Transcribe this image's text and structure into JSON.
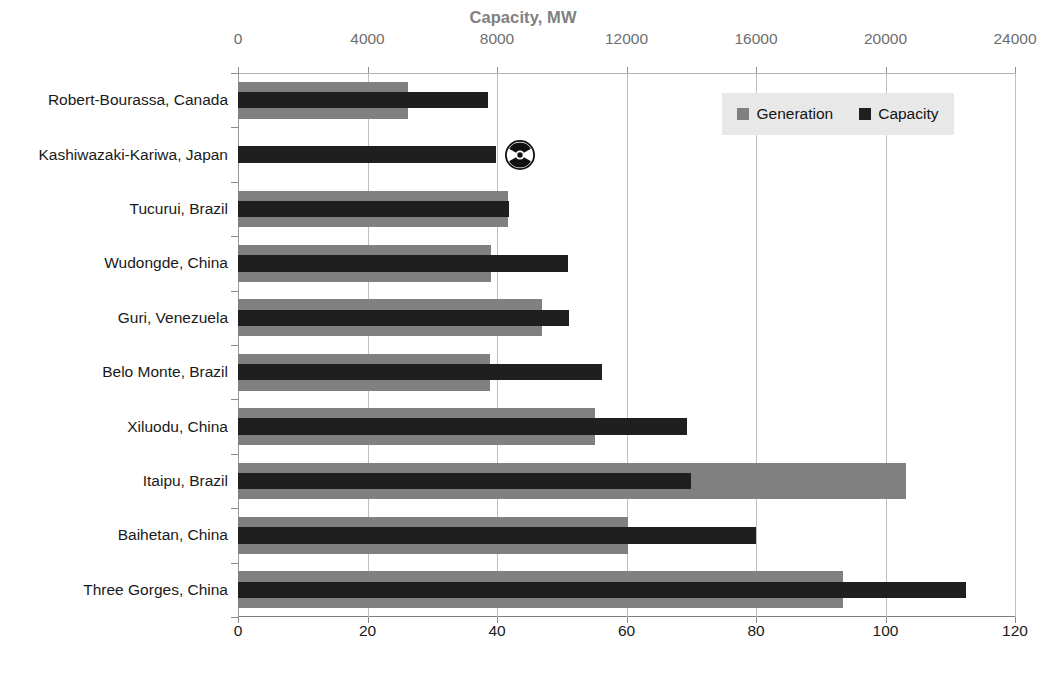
{
  "chart_data": {
    "type": "bar",
    "orientation": "horizontal",
    "title": "",
    "categories": [
      "Robert-Bourassa, Canada",
      "Kashiwazaki-Kariwa, Japan",
      "Tucurui, Brazil",
      "Wudongde, China",
      "Guri, Venezuela",
      "Belo Monte, Brazil",
      "Xiluodu, China",
      "Itaipu, Brazil",
      "Baihetan, China",
      "Three Gorges, China"
    ],
    "series": [
      {
        "name": "Generation",
        "unit": "TWh/year",
        "color": "#808080",
        "axis": "bottom",
        "values": [
          26.3,
          0,
          41.7,
          39.0,
          47.0,
          38.9,
          55.2,
          103.1,
          60.2,
          93.5
        ]
      },
      {
        "name": "Capacity",
        "unit": "MW",
        "color": "#1f1f1f",
        "axis": "top",
        "values": [
          7722,
          7965,
          8370,
          10200,
          10235,
          11233,
          13860,
          14000,
          16000,
          22500
        ]
      }
    ],
    "axes": {
      "top": {
        "label": "Capacity, MW",
        "ticks": [
          0,
          4000,
          8000,
          12000,
          16000,
          20000,
          24000
        ],
        "tick_labels": [
          "0",
          "4000",
          "8000",
          "12000",
          "16000",
          "20000",
          "24000"
        ],
        "min": 0,
        "max": 24000,
        "color": "#808080"
      },
      "bottom": {
        "label": "Generation, TWh/year",
        "ticks": [
          0,
          20,
          40,
          60,
          80,
          100,
          120
        ],
        "tick_labels": [
          "0",
          "20",
          "40",
          "60",
          "80",
          "100",
          "120"
        ],
        "min": 0,
        "max": 120,
        "color": "#141414"
      }
    },
    "grid": {
      "vertical": true,
      "horizontal": false
    },
    "legend": {
      "position": "top-right",
      "background": "#e8e8e8",
      "entries": [
        {
          "label": "Generation",
          "color": "#808080"
        },
        {
          "label": "Capacity",
          "color": "#1f1f1f"
        }
      ]
    },
    "annotations": [
      {
        "icon": "radiation-icon",
        "category": "Kashiwazaki-Kariwa, Japan",
        "note": ""
      }
    ]
  }
}
